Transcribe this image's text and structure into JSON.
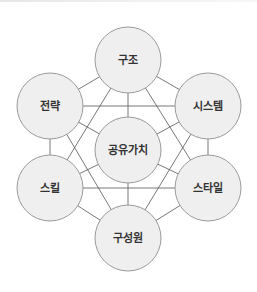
{
  "diagram": {
    "title": "",
    "colors": {
      "node_fill": "#efefef",
      "node_stroke": "#9a9a9a",
      "edge_stroke": "#555555",
      "text": "#333333"
    },
    "nodes": [
      {
        "id": "structure",
        "label": "구조",
        "cx": 128,
        "cy": 60,
        "r": 33
      },
      {
        "id": "strategy",
        "label": "전략",
        "cx": 50,
        "cy": 106,
        "r": 33
      },
      {
        "id": "systems",
        "label": "시스템",
        "cx": 208,
        "cy": 106,
        "r": 33
      },
      {
        "id": "shared_values",
        "label": "공유가치",
        "cx": 128,
        "cy": 150,
        "r": 33
      },
      {
        "id": "skills",
        "label": "스킬",
        "cx": 50,
        "cy": 188,
        "r": 33
      },
      {
        "id": "style",
        "label": "스타일",
        "cx": 208,
        "cy": 188,
        "r": 33
      },
      {
        "id": "staff",
        "label": "구성원",
        "cx": 128,
        "cy": 238,
        "r": 33
      }
    ],
    "edges": [
      [
        "structure",
        "strategy"
      ],
      [
        "structure",
        "systems"
      ],
      [
        "structure",
        "shared_values"
      ],
      [
        "structure",
        "skills"
      ],
      [
        "structure",
        "style"
      ],
      [
        "strategy",
        "systems"
      ],
      [
        "strategy",
        "shared_values"
      ],
      [
        "strategy",
        "skills"
      ],
      [
        "strategy",
        "staff"
      ],
      [
        "systems",
        "shared_values"
      ],
      [
        "systems",
        "style"
      ],
      [
        "systems",
        "staff"
      ],
      [
        "shared_values",
        "skills"
      ],
      [
        "shared_values",
        "style"
      ],
      [
        "shared_values",
        "staff"
      ],
      [
        "skills",
        "style"
      ],
      [
        "skills",
        "staff"
      ],
      [
        "style",
        "staff"
      ]
    ]
  }
}
